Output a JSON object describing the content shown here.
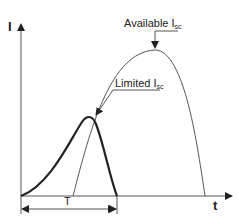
{
  "diagram": {
    "y_axis_label": "I",
    "x_axis_label": "t",
    "curves": [
      {
        "name": "Available I_sc",
        "label_main": "Available I",
        "label_sub": "sc",
        "style": "thin"
      },
      {
        "name": "Limited I_sc",
        "label_main": "Limited I",
        "label_sub": "sc",
        "style": "thick"
      }
    ],
    "dimension": {
      "label": "T"
    }
  },
  "colors": {
    "line": "#222222",
    "thin_line": "#555555"
  }
}
